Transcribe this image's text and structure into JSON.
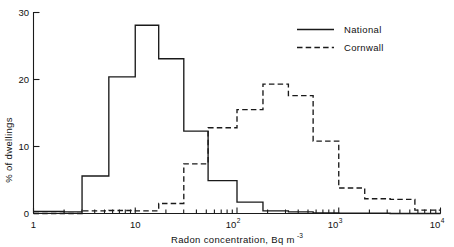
{
  "chart_data": {
    "type": "line",
    "subtype": "step-histogram",
    "title": "",
    "xlabel": "Radon concentration, Bq m−3",
    "xlabel_parts": {
      "text": "Radon concentration, Bq m",
      "superscript": "-3"
    },
    "ylabel": "% of dwellings",
    "xscale": "log",
    "xlim": [
      1,
      10000
    ],
    "ylim": [
      0,
      30
    ],
    "yticks": [
      0,
      10,
      20,
      30
    ],
    "ytick_labels": [
      "0",
      "10",
      "20",
      "30"
    ],
    "xticks": [
      1,
      10,
      100,
      1000,
      10000
    ],
    "xtick_labels": [
      "1",
      "10",
      "10",
      "10",
      "10"
    ],
    "xtick_superscripts": [
      "",
      "",
      "2",
      "3",
      "4"
    ],
    "xminor_ticks": [
      2,
      3,
      4,
      5,
      6,
      7,
      8,
      9,
      20,
      30,
      40,
      50,
      60,
      70,
      80,
      90,
      200,
      300,
      400,
      500,
      600,
      700,
      800,
      900,
      2000,
      3000,
      4000,
      5000,
      6000,
      7000,
      8000,
      9000
    ],
    "grid": false,
    "legend_position": "top-right",
    "series": [
      {
        "name": "National",
        "style": "solid",
        "color": "#1a1a1a",
        "bin_edges": [
          1,
          2,
          3,
          5.5,
          10,
          17,
          30,
          52,
          100,
          180,
          320,
          560,
          1000,
          1800,
          3200,
          10000
        ],
        "values": [
          0.3,
          0.25,
          5.6,
          20.4,
          28.1,
          23.1,
          12.3,
          4.9,
          1.7,
          0.4,
          0.25,
          0.1,
          0.05,
          0.05,
          0.0
        ]
      },
      {
        "name": "Cornwall",
        "style": "dashed",
        "color": "#1a1a1a",
        "bin_edges": [
          1,
          3,
          5.5,
          10,
          17,
          30,
          52,
          100,
          180,
          320,
          560,
          1000,
          1800,
          3200,
          5600,
          10000
        ],
        "values": [
          0.0,
          0.4,
          0.45,
          0.4,
          1.5,
          7.4,
          12.8,
          15.5,
          19.3,
          17.6,
          10.8,
          3.8,
          2.2,
          2.1,
          0.5
        ]
      }
    ]
  },
  "legend": {
    "entries": [
      {
        "label": "National",
        "style": "solid"
      },
      {
        "label": "Cornwall",
        "style": "dashed"
      }
    ]
  },
  "axes": {
    "y_axis_title": "% of dwellings",
    "x_axis_title": "Radon concentration, Bq m",
    "x_axis_title_superscript": "-3"
  }
}
